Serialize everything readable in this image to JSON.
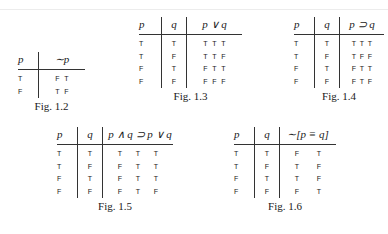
{
  "figures": [
    {
      "id": "fig-1-2",
      "caption": "Fig. 1.2",
      "headers": [
        "p",
        "∼p"
      ],
      "rows": [
        {
          "p": "T",
          "result": [
            "F",
            "T"
          ]
        },
        {
          "p": "F",
          "result": [
            "T",
            "F"
          ]
        }
      ]
    },
    {
      "id": "fig-1-3",
      "caption": "Fig. 1.3",
      "headers": [
        "p",
        "q",
        "p ∨ q"
      ],
      "rows": [
        {
          "p": "T",
          "q": "T",
          "result": [
            "T",
            "T",
            "T"
          ]
        },
        {
          "p": "T",
          "q": "F",
          "result": [
            "T",
            "T",
            "F"
          ]
        },
        {
          "p": "F",
          "q": "T",
          "result": [
            "F",
            "T",
            "T"
          ]
        },
        {
          "p": "F",
          "q": "F",
          "result": [
            "F",
            "F",
            "F"
          ]
        }
      ]
    },
    {
      "id": "fig-1-4",
      "caption": "Fig. 1.4",
      "headers": [
        "p",
        "q",
        "p ⊃ q"
      ],
      "rows": [
        {
          "p": "T",
          "q": "T",
          "result": [
            "T",
            "T",
            "T"
          ]
        },
        {
          "p": "T",
          "q": "F",
          "result": [
            "T",
            "F",
            "F"
          ]
        },
        {
          "p": "F",
          "q": "T",
          "result": [
            "F",
            "T",
            "T"
          ]
        },
        {
          "p": "F",
          "q": "F",
          "result": [
            "F",
            "T",
            "F"
          ]
        }
      ]
    },
    {
      "id": "fig-1-5",
      "caption": "Fig. 1.5",
      "headers": [
        "p",
        "q",
        "p ∧ q ⊃ p ∨ q"
      ],
      "rows": [
        {
          "p": "T",
          "q": "T",
          "result": [
            "T",
            "T",
            "T"
          ]
        },
        {
          "p": "T",
          "q": "F",
          "result": [
            "F",
            "T",
            "T"
          ]
        },
        {
          "p": "F",
          "q": "T",
          "result": [
            "F",
            "T",
            "T"
          ]
        },
        {
          "p": "F",
          "q": "F",
          "result": [
            "F",
            "T",
            "F"
          ]
        }
      ]
    },
    {
      "id": "fig-1-6",
      "caption": "Fig. 1.6",
      "headers": [
        "p",
        "q",
        "∼[p ≡ q]"
      ],
      "rows": [
        {
          "p": "T",
          "q": "T",
          "result": [
            "F",
            "T"
          ]
        },
        {
          "p": "T",
          "q": "F",
          "result": [
            "T",
            "F"
          ]
        },
        {
          "p": "F",
          "q": "T",
          "result": [
            "T",
            "F"
          ]
        },
        {
          "p": "F",
          "q": "F",
          "result": [
            "F",
            "T"
          ]
        }
      ]
    }
  ]
}
